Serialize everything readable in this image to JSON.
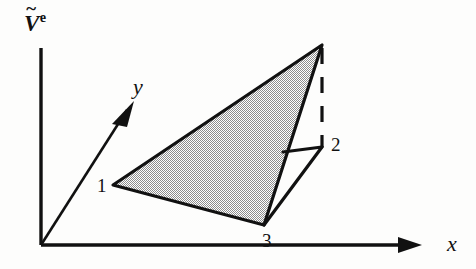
{
  "figure": {
    "background_color": "#fdfdfc",
    "ink_color": "#111111",
    "fill_pattern_color": "#a9a9a9"
  },
  "axes": {
    "vertical": {
      "label_base": "V",
      "label_accent": "~",
      "label_superscript": "e",
      "name": "v-tilde-e"
    },
    "horizontal": {
      "label": "x"
    },
    "depth": {
      "label": "y"
    },
    "origin_label": ""
  },
  "nodes": [
    {
      "label": "1"
    },
    {
      "label": "2"
    },
    {
      "label": "3"
    }
  ],
  "bleed_through": {
    "line_top": "                     ",
    "line_middle": "             ",
    "line_lower": "           "
  },
  "geometry": {
    "type": "line-drawing",
    "description": "Shaded triangular face of a tetrahedron drawn in an oblique axis frame",
    "origin": [
      41,
      245
    ],
    "vertical_axis_top": [
      41,
      48
    ],
    "horizontal_axis_end": [
      420,
      245
    ],
    "depth_axis_tip": [
      133,
      103
    ],
    "node_1": [
      113,
      185
    ],
    "node_2": [
      322,
      147
    ],
    "node_3": [
      264,
      225
    ],
    "apex": [
      322,
      45
    ],
    "edge_point": [
      283,
      152
    ],
    "dashed_segment": [
      [
        322,
        52
      ],
      [
        322,
        142
      ]
    ]
  }
}
